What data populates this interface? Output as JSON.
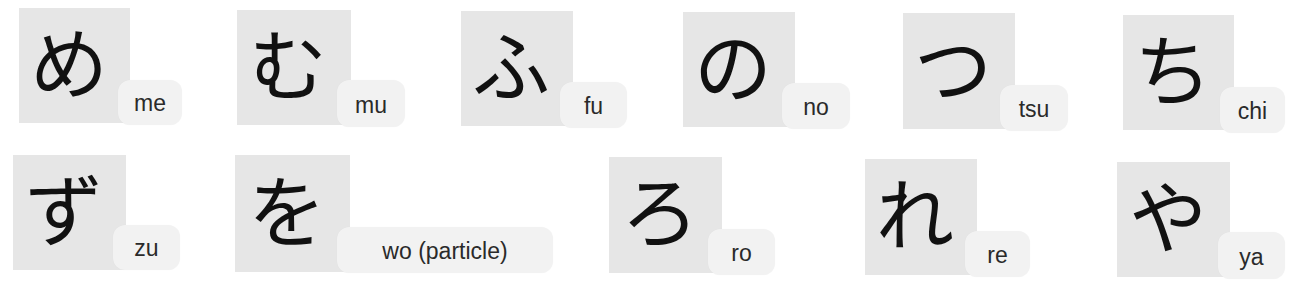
{
  "colors": {
    "background": "#ffffff",
    "kana_box": "#e6e6e6",
    "label_bg": "#f2f2f2",
    "kana_text": "#111111",
    "label_text": "#2a2a2a"
  },
  "cards": [
    {
      "kana": "め",
      "romaji": "me"
    },
    {
      "kana": "む",
      "romaji": "mu"
    },
    {
      "kana": "ふ",
      "romaji": "fu"
    },
    {
      "kana": "の",
      "romaji": "no"
    },
    {
      "kana": "つ",
      "romaji": "tsu"
    },
    {
      "kana": "ち",
      "romaji": "chi"
    },
    {
      "kana": "ず",
      "romaji": "zu"
    },
    {
      "kana": "を",
      "romaji": "wo (particle)"
    },
    {
      "kana": "ろ",
      "romaji": "ro"
    },
    {
      "kana": "れ",
      "romaji": "re"
    },
    {
      "kana": "や",
      "romaji": "ya"
    }
  ]
}
